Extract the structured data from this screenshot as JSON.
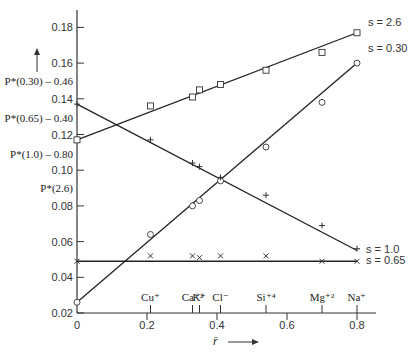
{
  "chart_data": {
    "type": "line",
    "title": "",
    "xlabel": "r̄",
    "ylabel": "P*",
    "xlim": [
      0,
      0.85
    ],
    "ylim": [
      0.02,
      0.19
    ],
    "x_ticks": [
      "0",
      "0.2",
      "0.4",
      "0.6",
      "0.8"
    ],
    "y_ticks": [
      "0.02",
      "0.04",
      "0.06",
      "0.08",
      "0.10",
      "0.12",
      "0.14",
      "0.16",
      "0.18"
    ],
    "grid": false,
    "y_annotations": [
      {
        "text": "P*(0.30) – 0.46",
        "at": 0.15
      },
      {
        "text": "P*(0.65) – 0.40",
        "at": 0.129
      },
      {
        "text": "P*(1.0) – 0.80",
        "at": 0.109
      },
      {
        "text": "P*(2.6)",
        "at": 0.09
      }
    ],
    "x_annotations": [
      {
        "text": "Cu⁺",
        "x": 0.21
      },
      {
        "text": "Ca⁺²",
        "x": 0.33
      },
      {
        "text": "K⁺",
        "x": 0.35
      },
      {
        "text": "Cl⁻",
        "x": 0.41
      },
      {
        "text": "Si⁺⁴",
        "x": 0.54
      },
      {
        "text": "Mg⁺²",
        "x": 0.7
      },
      {
        "text": "Na⁺",
        "x": 0.8
      }
    ],
    "series": [
      {
        "name": "s = 2.6",
        "marker": "square",
        "line": {
          "x": [
            0,
            0.8
          ],
          "y": [
            0.117,
            0.177
          ]
        },
        "points": [
          {
            "x": 0.0,
            "y": 0.117
          },
          {
            "x": 0.21,
            "y": 0.136
          },
          {
            "x": 0.33,
            "y": 0.141
          },
          {
            "x": 0.35,
            "y": 0.145
          },
          {
            "x": 0.41,
            "y": 0.148
          },
          {
            "x": 0.54,
            "y": 0.156
          },
          {
            "x": 0.7,
            "y": 0.166
          },
          {
            "x": 0.8,
            "y": 0.177
          }
        ]
      },
      {
        "name": "s = 0.30",
        "marker": "circle",
        "line": {
          "x": [
            0,
            0.8
          ],
          "y": [
            0.026,
            0.16
          ]
        },
        "points": [
          {
            "x": 0.0,
            "y": 0.026
          },
          {
            "x": 0.21,
            "y": 0.064
          },
          {
            "x": 0.33,
            "y": 0.08
          },
          {
            "x": 0.35,
            "y": 0.083
          },
          {
            "x": 0.41,
            "y": 0.094
          },
          {
            "x": 0.54,
            "y": 0.113
          },
          {
            "x": 0.7,
            "y": 0.138
          },
          {
            "x": 0.8,
            "y": 0.16
          }
        ]
      },
      {
        "name": "s = 1.0",
        "marker": "plus",
        "line": {
          "x": [
            0,
            0.8
          ],
          "y": [
            0.137,
            0.055
          ]
        },
        "points": [
          {
            "x": 0.0,
            "y": 0.137
          },
          {
            "x": 0.21,
            "y": 0.117
          },
          {
            "x": 0.33,
            "y": 0.104
          },
          {
            "x": 0.35,
            "y": 0.102
          },
          {
            "x": 0.41,
            "y": 0.096
          },
          {
            "x": 0.54,
            "y": 0.086
          },
          {
            "x": 0.7,
            "y": 0.069
          },
          {
            "x": 0.8,
            "y": 0.056
          }
        ]
      },
      {
        "name": "s = 0.65",
        "marker": "x",
        "line": {
          "x": [
            0,
            0.8
          ],
          "y": [
            0.049,
            0.049
          ]
        },
        "points": [
          {
            "x": 0.0,
            "y": 0.049
          },
          {
            "x": 0.21,
            "y": 0.052
          },
          {
            "x": 0.33,
            "y": 0.052
          },
          {
            "x": 0.35,
            "y": 0.051
          },
          {
            "x": 0.41,
            "y": 0.052
          },
          {
            "x": 0.54,
            "y": 0.052
          },
          {
            "x": 0.7,
            "y": 0.049
          },
          {
            "x": 0.8,
            "y": 0.049
          }
        ]
      }
    ]
  },
  "labels": {
    "s26": "s = 2.6",
    "s030": "s = 0.30",
    "s10": "s = 1.0",
    "s065": "s = 0.65",
    "xlabel": "r̄"
  }
}
